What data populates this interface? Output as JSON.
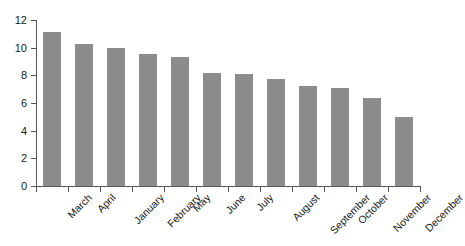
{
  "chart_data": {
    "type": "bar",
    "title": "",
    "subtitle": "",
    "xlabel": "",
    "ylabel": "",
    "categories": [
      "March",
      "April",
      "January",
      "February",
      "May",
      "June",
      "July",
      "August",
      "September",
      "October",
      "November",
      "December"
    ],
    "values": [
      11.15,
      10.3,
      9.95,
      9.55,
      9.3,
      8.15,
      8.1,
      7.75,
      7.2,
      7.05,
      6.35,
      5.0
    ],
    "series": [
      {
        "name": "",
        "values": [
          11.15,
          10.3,
          9.95,
          9.55,
          9.3,
          8.15,
          8.1,
          7.75,
          7.2,
          7.05,
          6.35,
          5.0
        ]
      }
    ],
    "ylim": [
      0,
      12
    ],
    "yticks": [
      0,
      2,
      4,
      6,
      8,
      10,
      12
    ],
    "ytick_labels": [
      "0",
      "2",
      "4",
      "6",
      "8",
      "10",
      "12"
    ],
    "grid": false,
    "legend": false,
    "legend_position": "none",
    "bar_color": "#8c8c8c",
    "axis_color": "#555555",
    "text_color": "#1a1a1a",
    "background_color": "#ffffff",
    "xtick_label_rotation": -45,
    "annotations": []
  }
}
